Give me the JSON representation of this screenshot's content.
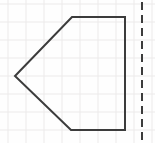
{
  "figure": {
    "canvas": {
      "width": 155,
      "height": 143
    },
    "background_color": "#fefefe",
    "grid": {
      "visible": true,
      "line_color": "#eceaea",
      "line_width": 1,
      "spacing": 18,
      "x_lines": [
        8,
        26,
        44,
        62,
        80,
        98,
        116,
        134,
        152
      ],
      "y_lines": [
        4,
        22,
        40,
        58,
        76,
        94,
        112,
        130
      ]
    },
    "shape": {
      "name": "pentagon",
      "description": "left-pointing arrow / home-plate pentagon",
      "stroke_color": "#3c3c3c",
      "stroke_width": 2,
      "fill": "none",
      "points": "72,17 125,17 125,130 71,130 15,76",
      "vertices": [
        {
          "label": "top-left",
          "x": 72,
          "y": 17
        },
        {
          "label": "top-right",
          "x": 125,
          "y": 17
        },
        {
          "label": "bottom-right",
          "x": 125,
          "y": 130
        },
        {
          "label": "bottom-left",
          "x": 71,
          "y": 130
        },
        {
          "label": "left-apex",
          "x": 15,
          "y": 76
        }
      ]
    },
    "dashed_line": {
      "name": "vertical-dashed-line",
      "orientation": "vertical",
      "x": 142,
      "y_start": 2,
      "y_end": 141,
      "stroke_color": "#3c3c3c",
      "stroke_width": 2,
      "dash_pattern": "8 5"
    }
  }
}
